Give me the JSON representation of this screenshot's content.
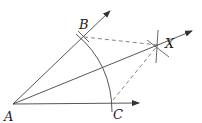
{
  "diagram": {
    "points": {
      "A": {
        "label": "A",
        "x": 13,
        "y": 104
      },
      "B": {
        "label": "B",
        "x": 83,
        "y": 37
      },
      "C": {
        "label": "C",
        "x": 111,
        "y": 103
      },
      "X": {
        "label": "X",
        "x": 158,
        "y": 45
      }
    },
    "rays": [
      {
        "from": "A",
        "through": "B",
        "to": [
          110,
          11
        ]
      },
      {
        "from": "A",
        "through": "C",
        "to": [
          139,
          103
        ]
      },
      {
        "from": "A",
        "through": "X",
        "to": [
          192,
          31
        ]
      }
    ],
    "dashed_segments": [
      [
        "B",
        "X"
      ],
      [
        "C",
        "X"
      ]
    ],
    "colors": {
      "stroke": "#333333",
      "label": "#222222"
    }
  }
}
